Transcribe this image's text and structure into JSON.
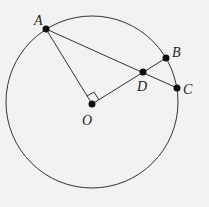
{
  "diagram": {
    "title": "",
    "circle": {
      "center": "O",
      "cx": 92,
      "cy": 102,
      "r": 86
    },
    "points": [
      {
        "name": "A",
        "x": 46,
        "y": 29,
        "label_x": 34,
        "label_y": 25
      },
      {
        "name": "B",
        "x": 166,
        "y": 58,
        "label_x": 172,
        "label_y": 57
      },
      {
        "name": "C",
        "x": 177,
        "y": 88,
        "label_x": 183,
        "label_y": 94
      },
      {
        "name": "D",
        "x": 143,
        "y": 72,
        "label_x": 137,
        "label_y": 91
      },
      {
        "name": "O",
        "x": 92,
        "y": 104,
        "label_x": 82,
        "label_y": 125
      }
    ],
    "segments": [
      {
        "from": "A",
        "to": "O"
      },
      {
        "from": "O",
        "to": "B"
      },
      {
        "from": "A",
        "to": "C"
      }
    ],
    "right_angle": {
      "at": "O",
      "between": [
        "A",
        "D"
      ]
    },
    "stroke_color": "#333333",
    "point_color": "#111111",
    "background": "#f2f2f2"
  }
}
